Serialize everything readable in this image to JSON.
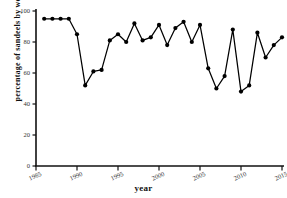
{
  "chart_data": {
    "type": "line",
    "title": "",
    "xlabel": "year",
    "ylabel": "percentage of sandeels by weight",
    "xlim": [
      1985,
      2015
    ],
    "ylim": [
      0,
      100
    ],
    "xticks": [
      1985,
      1990,
      1995,
      2000,
      2005,
      2010,
      2015
    ],
    "xticklabels": [
      "1985",
      "1990",
      "1995",
      "2000",
      "2005",
      "2010",
      "2015"
    ],
    "yticks": [
      0,
      20,
      40,
      60,
      80,
      100
    ],
    "yticklabels": [
      "0",
      "20",
      "40",
      "60",
      "80",
      "100"
    ],
    "grid": false,
    "legend": null,
    "marker": "filled-circle",
    "line_color": "#000000",
    "marker_color": "#000000",
    "x": [
      1986,
      1987,
      1988,
      1989,
      1990,
      1991,
      1992,
      1993,
      1994,
      1995,
      1996,
      1997,
      1998,
      1999,
      2000,
      2001,
      2002,
      2003,
      2004,
      2005,
      2006,
      2007,
      2008,
      2009,
      2010,
      2011,
      2012,
      2013,
      2014,
      2015
    ],
    "values": [
      95,
      95,
      95,
      95,
      85,
      52,
      61,
      62,
      81,
      85,
      80,
      92,
      81,
      83,
      91,
      78,
      89,
      93,
      80,
      91,
      63,
      50,
      58,
      88,
      48,
      52,
      86,
      70,
      78,
      83
    ],
    "series": [
      {
        "name": "percentage of sandeels by weight",
        "x": [
          1986,
          1987,
          1988,
          1989,
          1990,
          1991,
          1992,
          1993,
          1994,
          1995,
          1996,
          1997,
          1998,
          1999,
          2000,
          2001,
          2002,
          2003,
          2004,
          2005,
          2006,
          2007,
          2008,
          2009,
          2010,
          2011,
          2012,
          2013,
          2014,
          2015
        ],
        "values": [
          95,
          95,
          95,
          95,
          85,
          52,
          61,
          62,
          81,
          85,
          80,
          92,
          81,
          83,
          91,
          78,
          89,
          93,
          80,
          91,
          63,
          50,
          58,
          88,
          48,
          52,
          86,
          70,
          78,
          83
        ]
      }
    ]
  },
  "axes": {
    "x_title": "year",
    "y_title": "percentage of sandeels by weight"
  }
}
